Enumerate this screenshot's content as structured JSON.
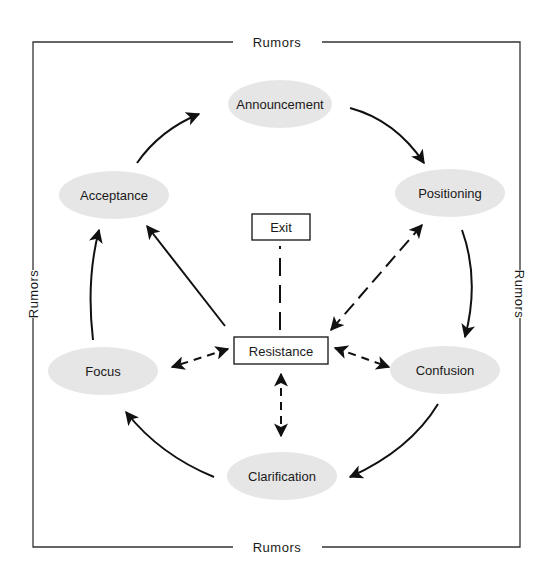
{
  "diagram": {
    "frame_label_top": "Rumors",
    "frame_label_bottom": "Rumors",
    "frame_label_left": "Rumors",
    "frame_label_right": "Rumors",
    "nodes": {
      "announcement": "Announcement",
      "positioning": "Positioning",
      "confusion": "Confusion",
      "clarification": "Clarification",
      "focus": "Focus",
      "acceptance": "Acceptance",
      "resistance": "Resistance",
      "exit": "Exit"
    },
    "edges": [
      {
        "from": "Announcement",
        "to": "Positioning",
        "style": "solid-curved"
      },
      {
        "from": "Positioning",
        "to": "Confusion",
        "style": "solid-curved"
      },
      {
        "from": "Confusion",
        "to": "Clarification",
        "style": "solid-curved"
      },
      {
        "from": "Clarification",
        "to": "Focus",
        "style": "solid-curved"
      },
      {
        "from": "Focus",
        "to": "Acceptance",
        "style": "solid-curved"
      },
      {
        "from": "Acceptance",
        "to": "Announcement",
        "style": "solid-curved"
      },
      {
        "from": "Resistance",
        "to": "Acceptance",
        "style": "solid"
      },
      {
        "from": "Resistance",
        "to": "Exit",
        "style": "long-dash-no-arrow"
      },
      {
        "from": "Resistance",
        "to": "Positioning",
        "style": "dashed-bidirectional"
      },
      {
        "from": "Resistance",
        "to": "Confusion",
        "style": "dashed-bidirectional"
      },
      {
        "from": "Resistance",
        "to": "Clarification",
        "style": "dashed-bidirectional"
      },
      {
        "from": "Resistance",
        "to": "Focus",
        "style": "dashed-bidirectional"
      }
    ],
    "colors": {
      "ellipse_fill": "#e6e6e6",
      "stroke": "#111111",
      "frame": "#333333"
    }
  }
}
